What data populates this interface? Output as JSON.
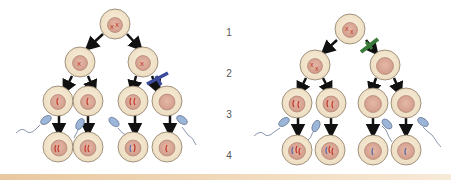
{
  "row_labels": [
    "1",
    "2",
    "3",
    "4"
  ],
  "colors": {
    "cell_fill": "#f3e6cf",
    "cell_stroke": "#8a7a66",
    "nucleus_fill": "#d9a796",
    "nucleus_stroke": "#a8776a",
    "chromosome_red": "#c0392b",
    "chromosome_blue": "#5a6ea8",
    "arrow": "#111111",
    "block_blue": "#3b4b9a",
    "block_green": "#3a7a3a",
    "sperm_head": "#9bb6d8",
    "bottom_stripe": "#e8c8a0"
  },
  "diagrams": [
    {
      "name": "left-lineage",
      "blocked_branch": "right",
      "block_color": "blue"
    },
    {
      "name": "right-lineage",
      "blocked_branch": "right",
      "block_color": "green"
    }
  ]
}
